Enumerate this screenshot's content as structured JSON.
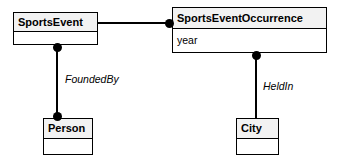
{
  "diagram": {
    "type": "uml-class-diagram",
    "background_color": "#ffffff",
    "line_color": "#000000",
    "name_compartment_fill": "#f2f2f2",
    "classes": [
      {
        "id": "sportsevent",
        "name": "SportsEvent",
        "attributes": [],
        "attributes_text": ""
      },
      {
        "id": "occurrence",
        "name": "SportsEventOccurrence",
        "attributes": [
          "year"
        ],
        "attributes_text": "year"
      },
      {
        "id": "person",
        "name": "Person",
        "attributes": [],
        "attributes_text": ""
      },
      {
        "id": "city",
        "name": "City",
        "attributes": [],
        "attributes_text": ""
      }
    ],
    "associations": [
      {
        "id": "sportsevent-occurrence",
        "from": "SportsEvent",
        "to": "SportsEventOccurrence",
        "label": "",
        "orientation": "horizontal"
      },
      {
        "id": "sportsevent-person",
        "from": "SportsEvent",
        "to": "Person",
        "label": "FoundedBy",
        "orientation": "vertical"
      },
      {
        "id": "occurrence-city",
        "from": "SportsEventOccurrence",
        "to": "City",
        "label": "HeldIn",
        "orientation": "vertical"
      }
    ]
  }
}
